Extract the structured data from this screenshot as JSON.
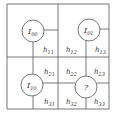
{
  "diagram": {
    "line_color": "#555555",
    "nodes": [
      {
        "id": "I00",
        "label": "I",
        "sub": "00",
        "cx": 33,
        "cy": 31
      },
      {
        "id": "I01",
        "label": "I",
        "sub": "01",
        "cx": 89,
        "cy": 30
      },
      {
        "id": "I10",
        "label": "I",
        "sub": "10",
        "cx": 32,
        "cy": 85
      },
      {
        "id": "unknown",
        "label": "?",
        "sub": "",
        "cx": 86,
        "cy": 87
      }
    ],
    "weights": [
      {
        "label": "h",
        "sub": "11",
        "x": 43,
        "y": 52
      },
      {
        "label": "h",
        "sub": "12",
        "x": 66,
        "y": 52
      },
      {
        "label": "h",
        "sub": "13",
        "x": 95,
        "y": 52
      },
      {
        "label": "h",
        "sub": "21",
        "x": 44,
        "y": 74
      },
      {
        "label": "h",
        "sub": "22",
        "x": 66,
        "y": 74
      },
      {
        "label": "h",
        "sub": "23",
        "x": 94,
        "y": 74
      },
      {
        "label": "h",
        "sub": "31",
        "x": 44,
        "y": 104
      },
      {
        "label": "h",
        "sub": "32",
        "x": 66,
        "y": 104
      },
      {
        "label": "h",
        "sub": "33",
        "x": 94,
        "y": 104
      }
    ]
  }
}
